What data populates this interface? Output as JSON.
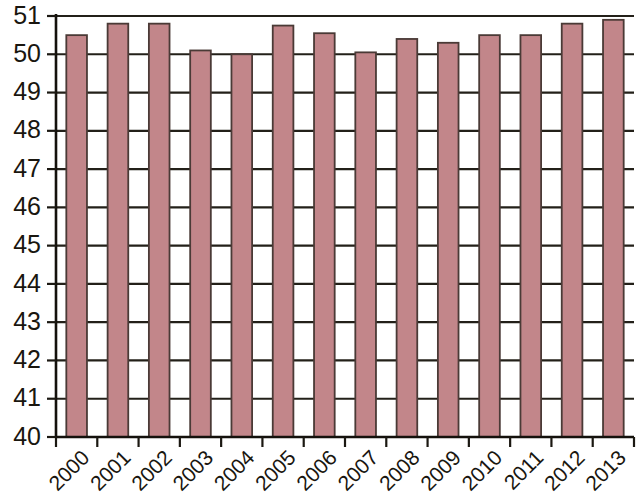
{
  "chart_data": {
    "type": "bar",
    "title": "",
    "subtitle": "",
    "xlabel": "",
    "ylabel": "",
    "categories": [
      "2000",
      "2001",
      "2002",
      "2003",
      "2004",
      "2005",
      "2006",
      "2007",
      "2008",
      "2009",
      "2010",
      "2011",
      "2012",
      "2013"
    ],
    "values": [
      50.5,
      50.8,
      50.8,
      50.1,
      50.0,
      50.75,
      50.55,
      50.05,
      50.4,
      50.3,
      50.5,
      50.5,
      50.8,
      50.9
    ],
    "series": [
      {
        "name": "",
        "values": [
          50.5,
          50.8,
          50.8,
          50.1,
          50.0,
          50.75,
          50.55,
          50.05,
          50.4,
          50.3,
          50.5,
          50.5,
          50.8,
          50.9
        ]
      }
    ],
    "ylim": [
      40,
      51
    ],
    "ytick_labels": [
      "40",
      "41",
      "42",
      "43",
      "44",
      "45",
      "46",
      "47",
      "48",
      "49",
      "50",
      "51"
    ],
    "ytick_values": [
      40,
      41,
      42,
      43,
      44,
      45,
      46,
      47,
      48,
      49,
      50,
      51
    ],
    "grid": true,
    "grid_axis": "y",
    "legend": false,
    "legend_position": "none",
    "annotations": [],
    "bar_color": "#c2868a",
    "bar_edge_color": "#4a3a36",
    "axis_color": "#1b1812",
    "background_color": "#ffffff",
    "xtick_label_rotation": 45
  }
}
